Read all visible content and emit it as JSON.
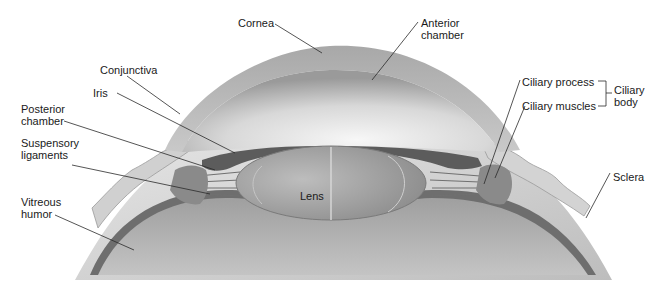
{
  "diagram": {
    "labels": {
      "cornea": "Cornea",
      "anterior_chamber": [
        "Anterior",
        "chamber"
      ],
      "conjunctiva": "Conjunctiva",
      "iris": "Iris",
      "posterior_chamber": [
        "Posterior",
        "chamber"
      ],
      "suspensory_ligaments": [
        "Suspensory",
        "ligaments"
      ],
      "vitreous_humor": [
        "Vitreous",
        "humor"
      ],
      "lens": "Lens",
      "ciliary_process": "Ciliary process",
      "ciliary_muscles": "Ciliary muscles",
      "ciliary_body": [
        "Ciliary",
        "body"
      ],
      "sclera": "Sclera"
    },
    "colors": {
      "background": "#ffffff",
      "cornea_light": "#e6e6e6",
      "cornea_dark": "#8f8f8f",
      "lens": "#a9a9a9",
      "iris": "#5a5a5a",
      "sclera": "#d4d4d4",
      "vitreous": "#b3b3b3",
      "leader_line": "#2a2a2a"
    }
  }
}
